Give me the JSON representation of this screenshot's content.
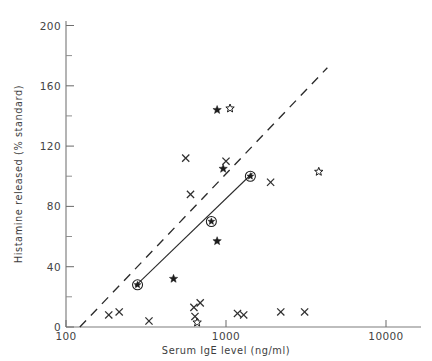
{
  "chart_data": {
    "type": "scatter",
    "title": "",
    "xlabel": "Serum IgE level (ng/ml)",
    "ylabel": "Histamine released (% standard)",
    "xscale": "log",
    "yscale": "linear",
    "xlim": [
      100,
      10000
    ],
    "ylim": [
      0,
      210
    ],
    "xticks": [
      100,
      1000,
      10000
    ],
    "xtick_labels": [
      "100",
      "1000",
      "10000"
    ],
    "yticks": [
      0,
      40,
      80,
      120,
      160,
      200
    ],
    "ytick_labels": [
      "0",
      "40",
      "80",
      "120",
      "160",
      "200"
    ],
    "yticks_minor": [
      20,
      60,
      100,
      140,
      180
    ],
    "grid": false,
    "legend": null,
    "series": [
      {
        "name": "cross",
        "marker": "x",
        "points": [
          {
            "x": 185,
            "y": 8
          },
          {
            "x": 215,
            "y": 10
          },
          {
            "x": 330,
            "y": 4
          },
          {
            "x": 630,
            "y": 13
          },
          {
            "x": 690,
            "y": 16
          },
          {
            "x": 640,
            "y": 7
          },
          {
            "x": 1180,
            "y": 9
          },
          {
            "x": 1290,
            "y": 8
          },
          {
            "x": 2200,
            "y": 10
          },
          {
            "x": 3100,
            "y": 10
          },
          {
            "x": 560,
            "y": 112
          },
          {
            "x": 600,
            "y": 88
          },
          {
            "x": 1000,
            "y": 110
          },
          {
            "x": 1900,
            "y": 96
          }
        ]
      },
      {
        "name": "filled-star",
        "marker": "star-filled",
        "points": [
          {
            "x": 470,
            "y": 32
          },
          {
            "x": 880,
            "y": 57
          },
          {
            "x": 960,
            "y": 105
          },
          {
            "x": 880,
            "y": 144
          }
        ]
      },
      {
        "name": "open-star",
        "marker": "star-open",
        "points": [
          {
            "x": 660,
            "y": 3
          },
          {
            "x": 1060,
            "y": 145
          },
          {
            "x": 3800,
            "y": 103
          }
        ]
      },
      {
        "name": "circled-fit-point",
        "marker": "star-in-circle",
        "points": [
          {
            "x": 280,
            "y": 28
          },
          {
            "x": 810,
            "y": 70
          },
          {
            "x": 1420,
            "y": 100
          }
        ]
      }
    ],
    "lines": [
      {
        "name": "regression-line",
        "style": "solid",
        "points": [
          {
            "x": 270,
            "y": 27
          },
          {
            "x": 1460,
            "y": 102
          }
        ]
      },
      {
        "name": "reference-line",
        "style": "dashed",
        "points": [
          {
            "x": 122,
            "y": 0
          },
          {
            "x": 4300,
            "y": 172
          }
        ]
      }
    ]
  }
}
